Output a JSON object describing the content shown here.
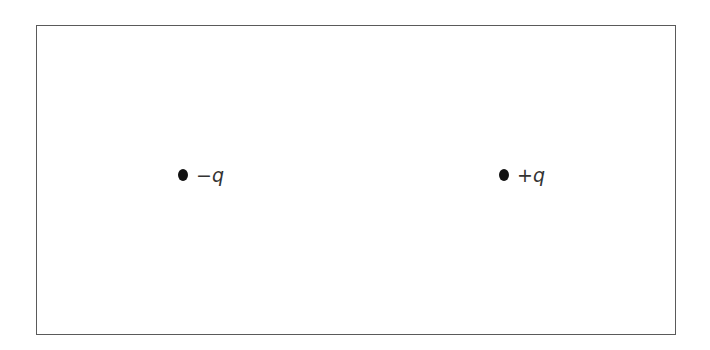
{
  "diagram": {
    "type": "point-charges",
    "frame": {
      "border_color": "#5a5a5a",
      "background": "#ffffff"
    },
    "charges": [
      {
        "id": "negative-charge",
        "sign": "−",
        "symbol": "q",
        "label": "−q",
        "dot_color": "#111111"
      },
      {
        "id": "positive-charge",
        "sign": "+",
        "symbol": "q",
        "label": "+q",
        "dot_color": "#111111"
      }
    ]
  }
}
